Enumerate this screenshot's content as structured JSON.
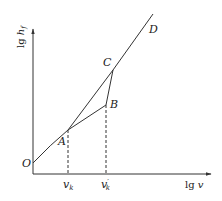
{
  "diagram": {
    "axes": {
      "y_label_main": "lg ",
      "y_label_var": "h",
      "y_label_sub": "f",
      "x_label_main": "lg ",
      "x_label_var": "v"
    },
    "points": {
      "O": "O",
      "A": "A",
      "B": "B",
      "C": "C",
      "D": "D"
    },
    "ticks": {
      "vk_var": "v",
      "vk_sub": "k",
      "vk_prime_var": "v",
      "vk_prime_mark": "′",
      "vk_prime_sub": "k"
    },
    "colors": {
      "line": "#333333",
      "text": "#222222",
      "background": "#ffffff"
    }
  }
}
